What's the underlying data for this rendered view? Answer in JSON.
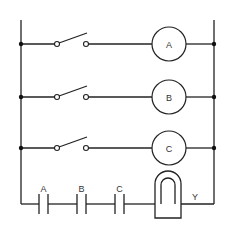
{
  "diagram": {
    "type": "ladder-logic",
    "rails": {
      "left_x": 21,
      "right_x": 214,
      "top_y": 20,
      "bottom_y": 204
    },
    "rungs": [
      {
        "y": 44,
        "input": "normally-open switch",
        "output": {
          "type": "coil",
          "label": "A"
        }
      },
      {
        "y": 97,
        "input": "normally-open switch",
        "output": {
          "type": "coil",
          "label": "B"
        }
      },
      {
        "y": 148,
        "input": "normally-open switch",
        "output": {
          "type": "coil",
          "label": "C"
        }
      }
    ],
    "bottom_rung": {
      "y": 204,
      "contacts": [
        {
          "label": "A",
          "type": "normally-open contact"
        },
        {
          "label": "B",
          "type": "normally-open contact"
        },
        {
          "label": "C",
          "type": "normally-open contact"
        }
      ],
      "output": {
        "type": "lamp/bell",
        "label": "Y"
      }
    },
    "colors": {
      "line": "#222222",
      "background": "#ffffff"
    }
  }
}
